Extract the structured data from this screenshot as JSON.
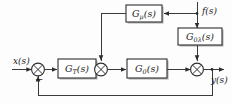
{
  "diagram": {
    "type": "control-system-block-diagram",
    "blocks": [
      {
        "id": "g_mu",
        "label_main": "G",
        "label_sub": "μ",
        "label_tail": "(s)",
        "full": "Gμ(s)"
      },
      {
        "id": "g_0lam",
        "label_main": "G",
        "label_sub": "0λ",
        "label_tail": "(s)",
        "full": "G0λ(s)"
      },
      {
        "id": "g_t",
        "label_main": "G",
        "label_sub": "T",
        "label_tail": "(s)",
        "full": "GT(s)"
      },
      {
        "id": "g_0",
        "label_main": "G",
        "label_sub": "0",
        "label_tail": "(s)",
        "full": "G0(s)"
      }
    ],
    "signals": [
      {
        "id": "input",
        "label_main": "x",
        "label_tail": "(s)",
        "full": "x(s)"
      },
      {
        "id": "output",
        "label_main": "y",
        "label_tail": "(s)",
        "full": "y(s)"
      },
      {
        "id": "disturbance",
        "label_main": "f",
        "label_tail": "(s)",
        "full": "f(s)"
      }
    ],
    "summing_junctions": [
      {
        "id": "sum1",
        "sign": "−"
      },
      {
        "id": "sum2",
        "sign": ""
      },
      {
        "id": "sum3",
        "sign": ""
      }
    ],
    "colors": {
      "line": "#3a3a3a",
      "block_stroke": "#2e2e2e",
      "block_fill": "#ffffff",
      "shadow": "#b9b9b9",
      "background": "#fdfdfd",
      "text": "#1c1c1c"
    }
  }
}
